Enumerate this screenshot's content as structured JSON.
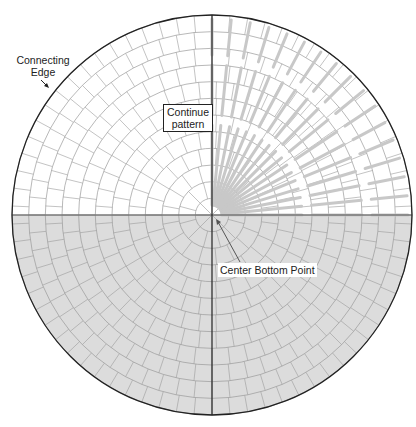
{
  "diagram": {
    "center": {
      "x": 212,
      "y": 215
    },
    "radius": 200,
    "rings": 12,
    "colors": {
      "bottom_fill": "#dcdcdc",
      "grid": "#9a9a9a",
      "rays": "#c8c8c8",
      "outline": "#222222"
    },
    "labels": {
      "connecting_edge_line1": "Connecting",
      "connecting_edge_line2": "Edge",
      "continue_line1": "Continue",
      "continue_line2": "pattern",
      "center_bottom_point": "Center Bottom Point"
    }
  }
}
